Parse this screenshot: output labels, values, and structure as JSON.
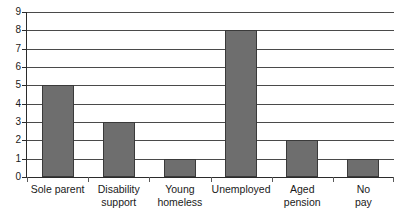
{
  "chart_data": {
    "type": "bar",
    "title": "",
    "subtitle": "",
    "xlabel": "",
    "ylabel": "",
    "categories": [
      "Sole parent",
      "Disability support",
      "Young homeless",
      "Unemployed",
      "Aged pension",
      "No pay"
    ],
    "category_label_lines": [
      "Sole parent",
      "Disability\nsupport",
      "Young\nhomeless",
      "Unemployed",
      "Aged\npension",
      "No\npay"
    ],
    "values": [
      5,
      3,
      1,
      8,
      2,
      1
    ],
    "ylim": [
      0,
      9
    ],
    "ytick_labels": [
      "0",
      "1",
      "2",
      "3",
      "4",
      "5",
      "6",
      "7",
      "8",
      "9"
    ],
    "ytick_values": [
      0,
      1,
      2,
      3,
      4,
      5,
      6,
      7,
      8,
      9
    ],
    "ytick_step": 1,
    "grid": true,
    "grid_axis": "y",
    "legend": false,
    "legend_position": "none",
    "bar_color": "#6e6e6e",
    "bar_border_color": "#3a3a3a",
    "gridline_color": "#4a4a4a",
    "axis_color": "#2b2b2b",
    "background_color": "#ffffff",
    "text_color": "#1a1a1a"
  }
}
